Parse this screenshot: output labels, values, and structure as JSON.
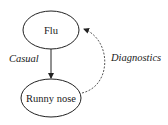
{
  "diagram": {
    "nodes": [
      {
        "id": "flu",
        "label": "Flu"
      },
      {
        "id": "runny_nose",
        "label": "Runny nose"
      }
    ],
    "edges": [
      {
        "from": "flu",
        "to": "runny_nose",
        "label": "Casual",
        "style": "solid"
      },
      {
        "from": "runny_nose",
        "to": "flu",
        "label": "Diagnostics",
        "style": "dashed"
      }
    ],
    "colors": {
      "stroke": "#222222",
      "dashed_stroke": "#444444",
      "background": "#ffffff"
    }
  }
}
